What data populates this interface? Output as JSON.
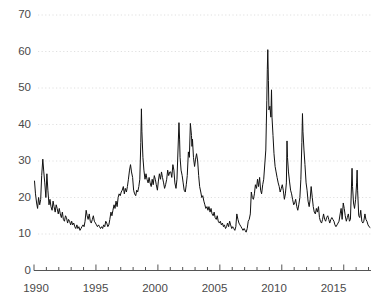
{
  "chart_data": {
    "type": "line",
    "title": "",
    "subtitle": "",
    "xlabel": "",
    "ylabel": "",
    "xlim": [
      1990.0,
      2017.2
    ],
    "ylim": [
      0,
      70
    ],
    "grid": true,
    "grid_axis": "y",
    "grid_style": "dotted",
    "legend": null,
    "legend_position": "none",
    "line_color": "#111111",
    "line_width": 1.0,
    "background_color": "#ffffff",
    "axis_color": "#555555",
    "tick_label_color": "#4a4a4a",
    "yticks": [
      0,
      10,
      20,
      30,
      40,
      50,
      60,
      70
    ],
    "ytick_labels": [
      "0",
      "10",
      "20",
      "30",
      "40",
      "50",
      "60",
      "70"
    ],
    "xticks_major": [
      1990,
      1995,
      2000,
      2005,
      2010,
      2015
    ],
    "xtick_labels": [
      "1990",
      "1995",
      "2000",
      "2005",
      "2010",
      "2015"
    ],
    "xticks_minor_step": 1,
    "series": [
      {
        "name": "Volatility Index",
        "x": [
          1990.04,
          1990.12,
          1990.21,
          1990.29,
          1990.37,
          1990.46,
          1990.54,
          1990.62,
          1990.71,
          1990.79,
          1990.87,
          1990.96,
          1991.04,
          1991.12,
          1991.21,
          1991.29,
          1991.37,
          1991.46,
          1991.54,
          1991.62,
          1991.71,
          1991.79,
          1991.87,
          1991.96,
          1992.04,
          1992.12,
          1992.21,
          1992.29,
          1992.37,
          1992.46,
          1992.54,
          1992.62,
          1992.71,
          1992.79,
          1992.87,
          1992.96,
          1993.04,
          1993.12,
          1993.21,
          1993.29,
          1993.37,
          1993.46,
          1993.54,
          1993.62,
          1993.71,
          1993.79,
          1993.87,
          1993.96,
          1994.04,
          1994.12,
          1994.21,
          1994.29,
          1994.37,
          1994.46,
          1994.54,
          1994.62,
          1994.71,
          1994.79,
          1994.87,
          1994.96,
          1995.04,
          1995.12,
          1995.21,
          1995.29,
          1995.37,
          1995.46,
          1995.54,
          1995.62,
          1995.71,
          1995.79,
          1995.87,
          1995.96,
          1996.04,
          1996.12,
          1996.21,
          1996.29,
          1996.37,
          1996.46,
          1996.54,
          1996.62,
          1996.71,
          1996.79,
          1996.87,
          1996.96,
          1997.04,
          1997.12,
          1997.21,
          1997.29,
          1997.37,
          1997.46,
          1997.54,
          1997.62,
          1997.71,
          1997.79,
          1997.87,
          1997.96,
          1998.04,
          1998.12,
          1998.21,
          1998.29,
          1998.37,
          1998.46,
          1998.54,
          1998.62,
          1998.67,
          1998.71,
          1998.79,
          1998.87,
          1998.96,
          1999.04,
          1999.12,
          1999.21,
          1999.29,
          1999.37,
          1999.46,
          1999.54,
          1999.62,
          1999.71,
          1999.79,
          1999.87,
          1999.96,
          2000.04,
          2000.12,
          2000.21,
          2000.29,
          2000.37,
          2000.46,
          2000.54,
          2000.62,
          2000.71,
          2000.79,
          2000.87,
          2000.96,
          2001.04,
          2001.12,
          2001.21,
          2001.29,
          2001.37,
          2001.46,
          2001.54,
          2001.7,
          2001.75,
          2001.79,
          2001.87,
          2001.96,
          2002.04,
          2002.12,
          2002.21,
          2002.29,
          2002.37,
          2002.46,
          2002.54,
          2002.62,
          2002.71,
          2002.75,
          2002.79,
          2002.87,
          2002.96,
          2003.04,
          2003.12,
          2003.21,
          2003.29,
          2003.37,
          2003.46,
          2003.54,
          2003.62,
          2003.71,
          2003.79,
          2003.87,
          2003.96,
          2004.04,
          2004.12,
          2004.21,
          2004.29,
          2004.37,
          2004.46,
          2004.54,
          2004.62,
          2004.71,
          2004.79,
          2004.87,
          2004.96,
          2005.04,
          2005.12,
          2005.21,
          2005.29,
          2005.37,
          2005.46,
          2005.54,
          2005.62,
          2005.71,
          2005.79,
          2005.87,
          2005.96,
          2006.04,
          2006.12,
          2006.21,
          2006.29,
          2006.37,
          2006.46,
          2006.54,
          2006.62,
          2006.71,
          2006.79,
          2006.87,
          2006.96,
          2007.04,
          2007.12,
          2007.21,
          2007.29,
          2007.37,
          2007.46,
          2007.54,
          2007.62,
          2007.71,
          2007.79,
          2007.87,
          2007.96,
          2008.04,
          2008.12,
          2008.21,
          2008.29,
          2008.37,
          2008.46,
          2008.54,
          2008.71,
          2008.79,
          2008.83,
          2008.87,
          2008.92,
          2008.96,
          2009.04,
          2009.12,
          2009.17,
          2009.21,
          2009.29,
          2009.37,
          2009.46,
          2009.54,
          2009.62,
          2009.71,
          2009.79,
          2009.87,
          2009.96,
          2010.04,
          2010.12,
          2010.21,
          2010.29,
          2010.37,
          2010.42,
          2010.46,
          2010.54,
          2010.62,
          2010.71,
          2010.79,
          2010.87,
          2010.96,
          2011.04,
          2011.12,
          2011.21,
          2011.29,
          2011.37,
          2011.46,
          2011.54,
          2011.62,
          2011.67,
          2011.71,
          2011.79,
          2011.87,
          2011.96,
          2012.04,
          2012.12,
          2012.21,
          2012.29,
          2012.37,
          2012.46,
          2012.54,
          2012.62,
          2012.71,
          2012.79,
          2012.87,
          2012.96,
          2013.04,
          2013.12,
          2013.21,
          2013.29,
          2013.37,
          2013.46,
          2013.54,
          2013.62,
          2013.71,
          2013.79,
          2013.87,
          2013.96,
          2014.04,
          2014.12,
          2014.21,
          2014.29,
          2014.37,
          2014.46,
          2014.54,
          2014.62,
          2014.71,
          2014.79,
          2014.87,
          2014.96,
          2015.04,
          2015.12,
          2015.21,
          2015.29,
          2015.37,
          2015.46,
          2015.54,
          2015.67,
          2015.71,
          2015.79,
          2015.87,
          2015.96,
          2016.04,
          2016.08,
          2016.12,
          2016.21,
          2016.29,
          2016.37,
          2016.46,
          2016.54,
          2016.62,
          2016.71,
          2016.79,
          2016.87,
          2016.96,
          2017.04,
          2017.12
        ],
        "values": [
          24.5,
          21.0,
          18.5,
          17.0,
          20.0,
          18.0,
          19.5,
          26.0,
          30.5,
          27.0,
          24.0,
          20.0,
          26.5,
          22.0,
          18.0,
          19.5,
          17.5,
          16.5,
          19.0,
          17.5,
          16.0,
          18.0,
          17.0,
          15.5,
          17.0,
          15.5,
          14.5,
          16.0,
          14.0,
          13.5,
          15.0,
          14.5,
          13.0,
          14.0,
          13.5,
          12.5,
          13.5,
          12.5,
          13.0,
          12.0,
          11.5,
          12.5,
          11.5,
          12.0,
          11.0,
          11.5,
          12.0,
          12.5,
          12.0,
          13.5,
          16.5,
          15.0,
          14.0,
          15.5,
          13.5,
          13.0,
          14.0,
          15.0,
          13.5,
          13.0,
          12.5,
          12.0,
          12.5,
          12.0,
          11.5,
          12.0,
          11.5,
          12.5,
          12.0,
          13.5,
          13.0,
          12.0,
          12.5,
          14.0,
          16.0,
          15.0,
          16.5,
          18.0,
          17.0,
          19.0,
          17.5,
          20.0,
          21.0,
          20.5,
          21.5,
          22.0,
          23.0,
          21.0,
          22.5,
          21.5,
          23.0,
          25.0,
          27.5,
          29.0,
          27.0,
          25.5,
          22.0,
          21.0,
          20.5,
          22.0,
          21.5,
          23.0,
          25.0,
          35.0,
          44.3,
          38.0,
          31.0,
          27.5,
          25.0,
          26.5,
          25.0,
          24.0,
          25.5,
          24.0,
          23.0,
          25.0,
          23.5,
          26.0,
          25.0,
          23.5,
          22.0,
          24.5,
          26.5,
          25.0,
          27.0,
          25.5,
          24.0,
          22.5,
          23.5,
          25.0,
          27.5,
          26.0,
          27.0,
          27.0,
          25.5,
          29.0,
          27.5,
          24.0,
          22.5,
          25.0,
          40.5,
          36.0,
          31.0,
          27.5,
          26.0,
          24.0,
          22.0,
          21.5,
          23.5,
          26.0,
          32.5,
          31.0,
          40.3,
          37.0,
          34.0,
          36.0,
          31.0,
          28.5,
          30.5,
          32.0,
          30.0,
          26.0,
          23.0,
          21.5,
          20.0,
          20.5,
          19.0,
          18.0,
          17.0,
          17.5,
          16.5,
          17.5,
          16.0,
          17.0,
          15.5,
          15.0,
          16.0,
          14.5,
          14.0,
          15.0,
          13.5,
          13.0,
          13.5,
          12.5,
          13.0,
          12.0,
          12.5,
          11.5,
          12.0,
          13.0,
          12.0,
          13.5,
          12.5,
          11.5,
          12.0,
          11.5,
          11.0,
          12.0,
          15.5,
          14.0,
          13.0,
          12.5,
          12.0,
          11.5,
          11.0,
          11.5,
          11.0,
          10.5,
          11.5,
          13.5,
          14.0,
          15.5,
          21.5,
          20.0,
          19.5,
          21.0,
          23.5,
          22.5,
          25.0,
          23.0,
          25.5,
          22.0,
          21.0,
          23.5,
          25.0,
          33.0,
          46.5,
          55.0,
          60.5,
          52.0,
          44.0,
          45.0,
          42.0,
          49.5,
          42.0,
          37.0,
          32.0,
          28.5,
          27.0,
          25.5,
          24.0,
          23.0,
          21.5,
          22.5,
          23.5,
          22.0,
          19.5,
          21.0,
          24.0,
          35.5,
          31.0,
          27.0,
          24.5,
          22.0,
          21.0,
          19.5,
          18.0,
          18.5,
          19.5,
          17.5,
          16.5,
          18.0,
          20.0,
          25.0,
          35.0,
          43.0,
          38.0,
          33.0,
          29.0,
          24.0,
          22.0,
          19.0,
          17.5,
          19.5,
          23.0,
          20.0,
          17.5,
          16.0,
          15.5,
          17.0,
          16.0,
          17.5,
          14.5,
          13.5,
          13.0,
          14.0,
          15.5,
          14.0,
          13.5,
          14.5,
          15.0,
          14.0,
          13.0,
          14.0,
          14.5,
          14.0,
          13.5,
          12.5,
          12.0,
          12.5,
          13.0,
          13.5,
          15.5,
          17.0,
          14.0,
          18.5,
          17.0,
          15.0,
          13.5,
          14.5,
          15.5,
          13.5,
          14.0,
          28.0,
          23.0,
          18.5,
          17.0,
          19.5,
          24.0,
          27.5,
          22.0,
          15.0,
          14.5,
          16.5,
          13.5,
          13.0,
          13.5,
          15.5,
          14.0,
          13.5,
          12.5,
          12.0,
          11.8
        ]
      }
    ]
  },
  "axes": {
    "ylabels": [
      "70",
      "60",
      "50",
      "40",
      "30",
      "20",
      "10",
      "0"
    ],
    "xlabels": [
      "1990",
      "1995",
      "2000",
      "2005",
      "2010",
      "2015"
    ]
  }
}
